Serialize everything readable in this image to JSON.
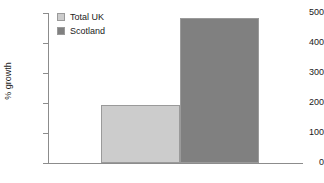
{
  "chart_data": {
    "type": "bar",
    "title": "",
    "xlabel": "",
    "ylabel": "% growth",
    "ylim": [
      0,
      500
    ],
    "yticks": [
      0,
      100,
      200,
      300,
      400,
      500
    ],
    "ytick_labels": [
      "0",
      "100",
      "200",
      "300",
      "400",
      "500"
    ],
    "grid": false,
    "legend_position": "top-left",
    "categories": [
      ""
    ],
    "series": [
      {
        "name": "Total UK",
        "values": [
          193
        ],
        "color": "#cccccc"
      },
      {
        "name": "Scotland",
        "values": [
          482
        ],
        "color": "#808080"
      }
    ]
  },
  "legend": {
    "items": [
      {
        "label": "Total UK",
        "color": "#cccccc"
      },
      {
        "label": "Scotland",
        "color": "#808080"
      }
    ]
  },
  "axis": {
    "y_title": "% growth",
    "y_labels": [
      "500",
      "400",
      "300",
      "200",
      "100",
      "0"
    ]
  },
  "colors": {
    "axis": "#8c8c8c",
    "bar_border": "#9a9a9a",
    "text": "#1a1a1a",
    "background": "#ffffff"
  }
}
